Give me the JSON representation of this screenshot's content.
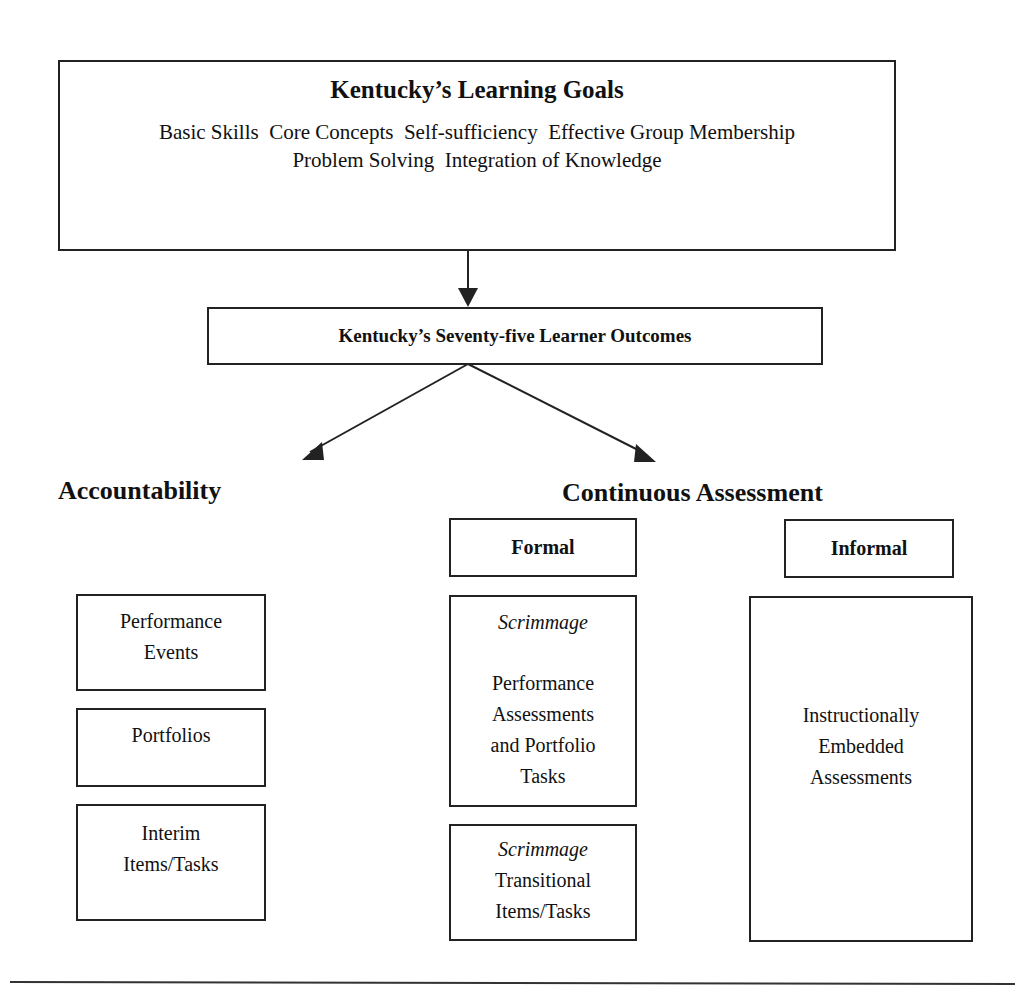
{
  "diagram": {
    "goals": {
      "title": "Kentucky’s Learning Goals",
      "line1": "Basic Skills  Core Concepts  Self-sufficiency  Effective Group Membership",
      "line2": "Problem Solving  Integration of Knowledge"
    },
    "outcomes": {
      "label": "Kentucky’s Seventy-five Learner Outcomes"
    },
    "accountability": {
      "heading": "Accountability",
      "items": [
        {
          "line1": "Performance",
          "line2": "Events"
        },
        {
          "line1": "Portfolios"
        },
        {
          "line1": "Interim",
          "line2": "Items/Tasks"
        }
      ]
    },
    "continuous": {
      "heading": "Continuous Assessment",
      "formal": {
        "label": "Formal",
        "box1": {
          "italic": "Scrimmage",
          "line1": "Performance",
          "line2": "Assessments",
          "line3": "and Portfolio",
          "line4": "Tasks"
        },
        "box2": {
          "italic": "Scrimmage",
          "line1": "Transitional",
          "line2": "Items/Tasks"
        }
      },
      "informal": {
        "label": "Informal",
        "box": {
          "line1": "Instructionally",
          "line2": "Embedded",
          "line3": "Assessments"
        }
      }
    },
    "colors": {
      "stroke": "#222222",
      "background": "#ffffff"
    }
  }
}
